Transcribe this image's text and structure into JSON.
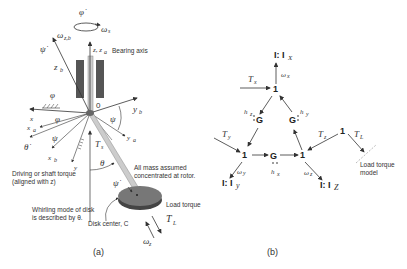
{
  "figure": {
    "panel_a": {
      "caption": "(a)",
      "labels": {
        "phi_dot": "φ̇",
        "omega_s": "ω",
        "omega_s_sub": "s",
        "psi_dot_top": "ψ̇",
        "omega_zb": "ω",
        "omega_zb_sub": "z,b",
        "z_za": "z, z",
        "z_za_sub": "a",
        "bearing_axis": "Bearing axis",
        "z_b": "z",
        "z_b_sub": "b",
        "phi_ground": "φ",
        "origin": "0",
        "x": "x",
        "phi_angle": "φ",
        "y_b": "y",
        "y_b_sub": "b",
        "psi_angle": "ψ",
        "x_a": "x",
        "x_a_sub": "a",
        "theta_dot": "θ̇",
        "psi_angle2": "ψ",
        "x_b": "x",
        "x_b_sub": "b",
        "y": "y",
        "T_s": "T",
        "T_s_sub": "s",
        "y_a": "y",
        "y_a_sub": "a",
        "theta": "θ",
        "driving_torque_1": "Driving or shaft torque",
        "driving_torque_2": "(aligned with z)",
        "all_mass_1": "All mass assumed",
        "all_mass_2": "concentrated at rotor.",
        "psi_dot_disk": "ψ̇",
        "whirling_1": "Whirling mode of disk",
        "whirling_2": "is described by θ.",
        "disk_center": "Disk center, C",
        "load_torque": "Load torque",
        "T_L": "T",
        "T_L_sub": "L",
        "omega_z": "ω",
        "omega_z_sub": "z"
      }
    },
    "panel_b": {
      "caption": "(b)",
      "labels": {
        "I_x": "I: I",
        "I_x_sub": "X",
        "omega_x": "ω",
        "omega_x_sub": "x",
        "T_x": "T",
        "T_x_sub": "x",
        "junction_top": "1",
        "h_z": "h",
        "h_z_sub": "z",
        "G_left": "G",
        "G_right": "G",
        "h_y": "h",
        "h_y_sub": "y",
        "T_y": "T",
        "T_y_sub": "y",
        "junction_left": "1",
        "G_bottom": "G",
        "h_x": "h",
        "h_x_sub": "x",
        "junction_right": "1",
        "omega_y": "ω",
        "omega_y_sub": "y",
        "I_y": "I: I",
        "I_y_sub": "y",
        "omega_z": "ω",
        "omega_z_sub": "z",
        "I_z": "I: I",
        "I_z_sub": "Z",
        "T_z": "T",
        "T_z_sub": "z",
        "junction_load": "1",
        "T_L": "T",
        "T_L_sub": "L",
        "load_model_1": "Load torque",
        "load_model_2": "model"
      }
    },
    "colors": {
      "line": "#444444",
      "bearing": "#555555",
      "shaft": "#bbbbbb",
      "disk_top": "#777777",
      "disk_side": "#444444",
      "dashed": "#aaaaaa"
    }
  }
}
